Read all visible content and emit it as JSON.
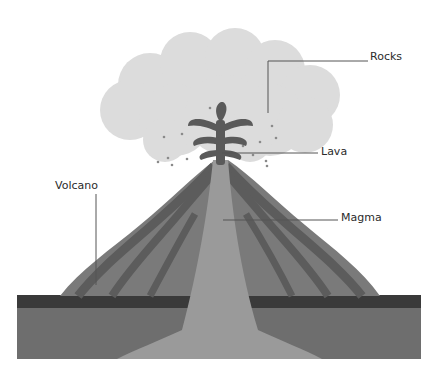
{
  "diagram": {
    "labels": {
      "rocks": "Rocks",
      "lava": "Lava",
      "volcano": "Volcano",
      "magma": "Magma"
    },
    "colors": {
      "cloud": "#dcdcdc",
      "lava": "#5a5a5a",
      "volcano_outer": "#7a7a7a",
      "volcano_band_dark": "#5c5c5c",
      "volcano_band_light": "#8a8a8a",
      "magma": "#9a9a9a",
      "ground_top": "#3a3a3a",
      "ground": "#6e6e6e",
      "leader_line": "#555555"
    }
  }
}
